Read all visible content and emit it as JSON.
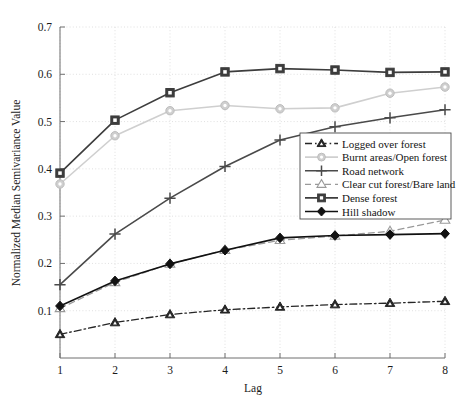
{
  "chart_data": {
    "type": "line",
    "title": "",
    "xlabel": "Lag",
    "ylabel": "Normalized Median Semivariance Value",
    "x": [
      1,
      2,
      3,
      4,
      5,
      6,
      7,
      8
    ],
    "xlim": [
      1,
      8
    ],
    "ylim": [
      0.0,
      0.7
    ],
    "xticks": [
      "1",
      "2",
      "3",
      "4",
      "5",
      "6",
      "7",
      "8"
    ],
    "yticks": [
      "0.1",
      "0.2",
      "0.3",
      "0.4",
      "0.5",
      "0.6",
      "0.7"
    ],
    "ytick_values": [
      0.1,
      0.2,
      0.3,
      0.4,
      0.5,
      0.6,
      0.7
    ],
    "grid": true,
    "legend_position": "center-right",
    "series": [
      {
        "name": "Logged over forest",
        "marker": "triangle-up",
        "linestyle": "dashdot",
        "color": "#262626",
        "values": [
          0.05,
          0.075,
          0.092,
          0.102,
          0.108,
          0.113,
          0.116,
          0.12
        ]
      },
      {
        "name": "Burnt areas/Open forest",
        "marker": "circle",
        "linestyle": "solid",
        "color": "#cfcfcf",
        "values": [
          0.368,
          0.47,
          0.523,
          0.534,
          0.527,
          0.529,
          0.56,
          0.573
        ]
      },
      {
        "name": "Road network",
        "marker": "plus",
        "linestyle": "solid",
        "color": "#4a4a4a",
        "values": [
          0.155,
          0.262,
          0.338,
          0.405,
          0.461,
          0.489,
          0.508,
          0.525
        ]
      },
      {
        "name": "Clear cut forest/Bare land",
        "marker": "triangle-up-open",
        "linestyle": "dashed",
        "color": "#9a9a9a",
        "values": [
          0.105,
          0.16,
          0.199,
          0.228,
          0.249,
          0.258,
          0.268,
          0.292
        ]
      },
      {
        "name": "Dense forest",
        "marker": "square",
        "linestyle": "solid",
        "color": "#3d3d3d",
        "values": [
          0.391,
          0.503,
          0.561,
          0.605,
          0.612,
          0.609,
          0.604,
          0.605
        ]
      },
      {
        "name": "Hill shadow",
        "marker": "diamond",
        "linestyle": "solid",
        "color": "#111111",
        "values": [
          0.11,
          0.163,
          0.199,
          0.228,
          0.254,
          0.259,
          0.261,
          0.263
        ]
      }
    ]
  },
  "legend": {
    "entries": [
      "Logged over forest",
      "Burnt areas/Open forest",
      "Road network",
      "Clear cut forest/Bare land",
      "Dense forest",
      "Hill shadow"
    ]
  },
  "colors": {
    "background": "#ffffff",
    "axis": "#6f6f6f",
    "grid": "#d8d8d8",
    "text": "#1a1a1a"
  }
}
